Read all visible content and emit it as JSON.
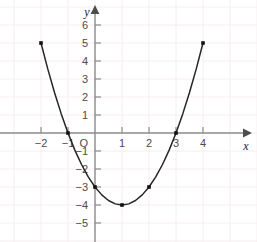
{
  "chart_data": {
    "type": "line",
    "title": "",
    "subtitle": "",
    "xlabel": "x",
    "ylabel": "y",
    "xlim": [
      -2.6,
      4.6
    ],
    "ylim": [
      -5.6,
      6.6
    ],
    "grid": true,
    "legend": null,
    "equation": "y = x^2 - 2x - 3",
    "x_ticks": [
      -2,
      -1,
      1,
      2,
      3,
      4
    ],
    "x_tick_labels": [
      "−2",
      "−1",
      "1",
      "2",
      "3",
      "4"
    ],
    "y_ticks": [
      6,
      5,
      4,
      3,
      2,
      1,
      -1,
      -2,
      -3,
      -4,
      -5
    ],
    "y_tick_labels": [
      "6",
      "5",
      "4",
      "3",
      "2",
      "1",
      "−1",
      "−2",
      "−3",
      "−4",
      "−5"
    ],
    "origin_label": "O",
    "series": [
      {
        "name": "parabola",
        "color": "#262626",
        "x": [
          -2,
          -1.75,
          -1.5,
          -1.25,
          -1,
          -0.75,
          -0.5,
          -0.25,
          0,
          0.25,
          0.5,
          0.75,
          1,
          1.25,
          1.5,
          1.75,
          2,
          2.25,
          2.5,
          2.75,
          3,
          3.25,
          3.5,
          3.75,
          4
        ],
        "y": [
          5,
          3.5625,
          2.25,
          1.0625,
          0,
          -0.9375,
          -1.75,
          -2.4375,
          -3,
          -3.4375,
          -3.75,
          -3.9375,
          -4,
          -3.9375,
          -3.75,
          -3.4375,
          -3,
          -2.4375,
          -1.75,
          -0.9375,
          0,
          1.0625,
          2.25,
          3.5625,
          5
        ]
      }
    ],
    "marked_points": [
      {
        "x": -2,
        "y": 5,
        "label": "left-endpoint"
      },
      {
        "x": -1,
        "y": 0,
        "label": "left-root"
      },
      {
        "x": 0,
        "y": -3,
        "label": "y-intercept"
      },
      {
        "x": 1,
        "y": -4,
        "label": "vertex"
      },
      {
        "x": 2,
        "y": -3,
        "label": "point-2"
      },
      {
        "x": 3,
        "y": 0,
        "label": "right-root"
      },
      {
        "x": 4,
        "y": 5,
        "label": "right-endpoint"
      }
    ],
    "colors": {
      "background": "#ffffff",
      "grid": "#f7eef0",
      "axis": "#8c8c8c",
      "curve": "#262626",
      "point": "#111111",
      "tick_text": "#4d4d4d"
    }
  }
}
